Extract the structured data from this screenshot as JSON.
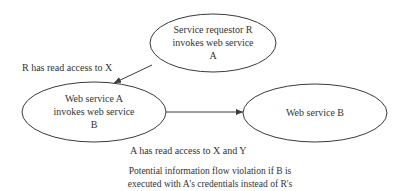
{
  "nodes": [
    {
      "id": "requestor",
      "lines": [
        "Service requestor R",
        "invokes web service",
        "A"
      ]
    },
    {
      "id": "service_a",
      "lines": [
        "Web service A",
        "invokes web service",
        "B"
      ]
    },
    {
      "id": "service_b",
      "lines": [
        "Web service B"
      ]
    }
  ],
  "edges": [
    {
      "from": "requestor",
      "to": "service_a",
      "label": "R has read access to X"
    },
    {
      "from": "service_a",
      "to": "service_b",
      "label": "A has read access to X and Y"
    }
  ],
  "caption": {
    "lines": [
      "Potential information flow violation if B is",
      "executed with A's credentials instead of R's"
    ]
  },
  "colors": {
    "stroke": "#3a3a3a",
    "background": "#ffffff"
  }
}
